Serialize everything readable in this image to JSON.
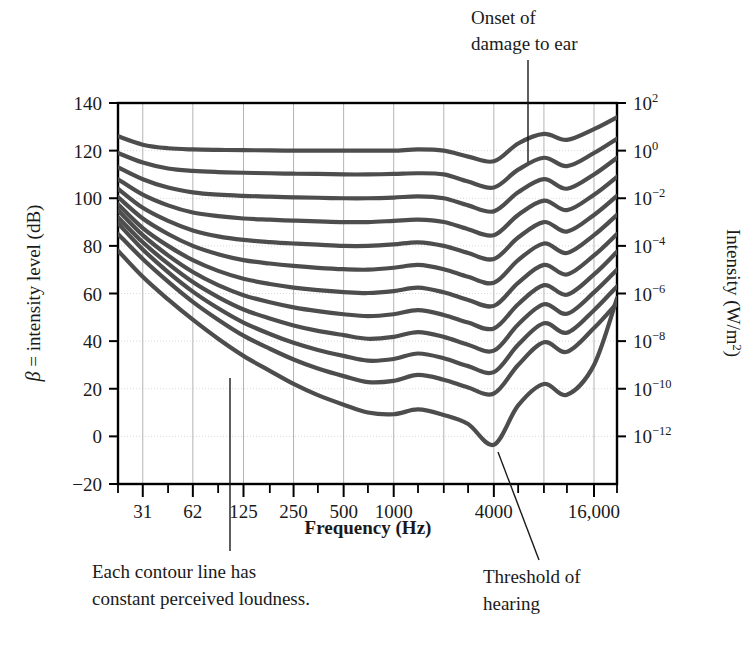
{
  "figure": {
    "kind": "equal-loudness-contour-plot"
  },
  "axes": {
    "y_left": {
      "title_beta": "β",
      "title_rest": " = intensity level (dB)",
      "ticks": [
        "140",
        "120",
        "100",
        "80",
        "60",
        "40",
        "20",
        "0",
        "−20"
      ],
      "values": [
        140,
        120,
        100,
        80,
        60,
        40,
        20,
        0,
        -20
      ]
    },
    "y_right": {
      "title": "Intensity (W/m",
      "title_sup": "2",
      "title_end": ")",
      "ticks": [
        {
          "base": "10",
          "exp": "2"
        },
        {
          "base": "10",
          "exp": "0"
        },
        {
          "base": "10",
          "exp": "−2"
        },
        {
          "base": "10",
          "exp": "−4"
        },
        {
          "base": "10",
          "exp": "−6"
        },
        {
          "base": "10",
          "exp": "−8"
        },
        {
          "base": "10",
          "exp": "−10"
        },
        {
          "base": "10",
          "exp": "−12"
        }
      ],
      "db_positions": [
        140,
        120,
        100,
        80,
        60,
        40,
        20,
        0
      ]
    },
    "x": {
      "title": "Frequency (Hz)",
      "ticks": [
        "31",
        "62",
        "125",
        "250",
        "500",
        "1000",
        "4000",
        "16,000"
      ],
      "values": [
        31,
        62,
        125,
        250,
        500,
        1000,
        4000,
        16000
      ]
    }
  },
  "annotations": [
    {
      "name": "onset-of-damage",
      "line1": "Onset of",
      "line2": "damage to ear"
    },
    {
      "name": "each-contour-line",
      "line1": "Each contour line has",
      "line2": "constant perceived loudness."
    },
    {
      "name": "threshold-of-hearing",
      "line1": "Threshold of",
      "line2": "hearing"
    }
  ],
  "colors": {
    "curve": "#4d4d4d",
    "axis": "#000000",
    "grid": "#b3b3b3",
    "grid_minor": "#d9d9d9",
    "text": "#1a1a1a",
    "background": "#ffffff"
  },
  "chart_data": {
    "type": "line",
    "title": "",
    "xlabel": "Frequency (Hz)",
    "ylabel": "β = intensity level (dB)",
    "ylabel_right": "Intensity (W/m²)",
    "xscale": "log2-octave",
    "xlim": [
      22,
      22000
    ],
    "ylim": [
      -20,
      140
    ],
    "xticks": [
      31,
      62,
      125,
      250,
      500,
      1000,
      4000,
      16000
    ],
    "yticks": [
      -20,
      0,
      20,
      40,
      60,
      80,
      100,
      120,
      140
    ],
    "grid": true,
    "legend": "none",
    "x": [
      22,
      31,
      44,
      62,
      88,
      125,
      180,
      250,
      350,
      500,
      700,
      1000,
      1400,
      2000,
      2800,
      4000,
      5600,
      8000,
      11000,
      16000,
      22000
    ],
    "series": [
      {
        "name": "contour-120-phon",
        "values": [
          126,
          122.5,
          121,
          120.5,
          120.3,
          120.2,
          120.1,
          120,
          120,
          120,
          120,
          120,
          120.5,
          120,
          117.5,
          115.5,
          123,
          127,
          124.5,
          129,
          134
        ]
      },
      {
        "name": "contour-110-phon",
        "values": [
          119,
          115,
          112.5,
          111.5,
          111,
          110.7,
          110.5,
          110.3,
          110.2,
          110,
          110,
          110.2,
          110.5,
          110,
          107,
          104.5,
          112,
          117,
          113.5,
          119,
          125
        ]
      },
      {
        "name": "contour-100-phon",
        "values": [
          113,
          108,
          104.5,
          102.5,
          101.5,
          101,
          100.7,
          100.4,
          100.2,
          100,
          100,
          100.3,
          100.8,
          100,
          97,
          94.5,
          102.5,
          108,
          104,
          110,
          117
        ]
      },
      {
        "name": "contour-90-phon",
        "values": [
          108,
          101.5,
          97,
          94,
          92.5,
          91.5,
          91,
          90.6,
          90.3,
          90,
          90,
          90.5,
          91,
          90,
          87,
          84.5,
          93,
          99,
          95,
          101.5,
          109
        ]
      },
      {
        "name": "contour-80-phon",
        "values": [
          104,
          96,
          90.5,
          86.5,
          84,
          82.5,
          81.6,
          81,
          80.5,
          80,
          80,
          80.6,
          81.5,
          80,
          77,
          74.5,
          83.5,
          90,
          86,
          93,
          101
        ]
      },
      {
        "name": "contour-70-phon",
        "values": [
          100.5,
          91.5,
          85,
          80,
          76.5,
          74,
          72.6,
          71.6,
          70.8,
          70.2,
          70,
          70.8,
          72,
          70.2,
          67,
          64.5,
          74,
          81,
          77,
          84.5,
          93
        ]
      },
      {
        "name": "contour-60-phon",
        "values": [
          97.5,
          87.5,
          80,
          74,
          69.5,
          66.2,
          64,
          62.5,
          61.4,
          60.6,
          60.2,
          61,
          62.5,
          60.5,
          57.3,
          54.8,
          64.5,
          72,
          68,
          76,
          85
        ]
      },
      {
        "name": "contour-50-phon",
        "values": [
          95,
          84.5,
          76,
          69,
          63.5,
          59.3,
          56.3,
          54.2,
          52.6,
          51.3,
          50.5,
          51.3,
          53,
          51,
          47.8,
          45.3,
          55.5,
          63.5,
          59.5,
          68,
          77.5
        ]
      },
      {
        "name": "contour-40-phon",
        "values": [
          92,
          81.5,
          72.5,
          64.8,
          58.5,
          53.3,
          49.5,
          46.6,
          44.3,
          42.5,
          41,
          41.8,
          43.8,
          41.8,
          38.5,
          36,
          47,
          55.5,
          51.5,
          60.5,
          70
        ]
      },
      {
        "name": "contour-30-phon",
        "values": [
          89.5,
          78.5,
          69,
          60.8,
          53.8,
          47.8,
          43,
          39.3,
          36.3,
          33.8,
          31.8,
          32.5,
          34.8,
          32.8,
          29.5,
          27,
          38.5,
          47.5,
          43.5,
          53,
          63
        ]
      },
      {
        "name": "contour-20-phon",
        "values": [
          85,
          74.5,
          65,
          56.5,
          49,
          42.3,
          36.8,
          32.3,
          28.5,
          25.3,
          22.8,
          23.3,
          25.8,
          23.8,
          20.5,
          18,
          30,
          39.5,
          35.5,
          45.5,
          56
        ]
      },
      {
        "name": "contour-threshold",
        "values": [
          78,
          67,
          57.5,
          49,
          41,
          33.8,
          27.5,
          22,
          17.3,
          13.3,
          10,
          9.3,
          11.3,
          9,
          5.2,
          -3.5,
          13,
          22,
          17.5,
          30,
          58
        ]
      }
    ]
  }
}
